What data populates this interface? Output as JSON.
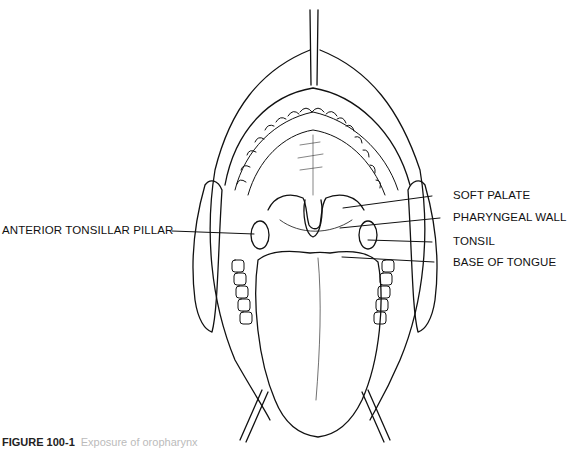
{
  "labels": {
    "soft_palate": "SOFT PALATE",
    "pharyngeal_wall": "PHARYNGEAL WALL",
    "tonsil": "TONSIL",
    "base_of_tongue": "BASE OF TONGUE",
    "anterior_tonsillar_pillar": "ANTERIOR TONSILLAR PILLAR"
  },
  "caption": {
    "figure_number": "FIGURE 100-1",
    "text": "Exposure of oropharynx"
  }
}
